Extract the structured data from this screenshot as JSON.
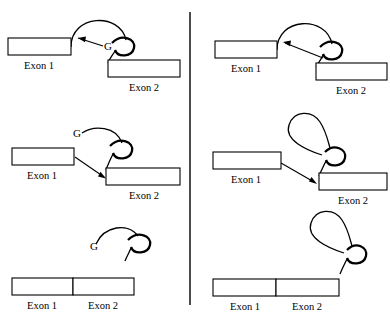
{
  "figure": {
    "background_color": "#ffffff",
    "ink_color": "#000000",
    "width": 390,
    "height": 319,
    "divider": {
      "x": 190,
      "y1": 12,
      "y2": 305
    }
  },
  "labels": {
    "exon1": "Exon 1",
    "exon2": "Exon 2",
    "branch_g": "G"
  },
  "panels": [
    {
      "id": "left-column",
      "name": "group-ii-style-lariat-with-g",
      "rows": [
        {
          "id": "left-row-1",
          "stage": "pre-splice-arched-intron",
          "exon1_label": "Exon 1",
          "exon2_label": "Exon 2",
          "branch_label": "G",
          "has_branch_label": true,
          "has_arrow": true,
          "arrow_direction": "right-to-left",
          "intron_shape": "arch"
        },
        {
          "id": "left-row-2",
          "stage": "first-transesterification-lariat-forming",
          "exon1_label": "Exon 1",
          "exon2_label": "Exon 2",
          "branch_label": "G",
          "has_branch_label": true,
          "has_arrow": true,
          "arrow_direction": "left-to-right",
          "intron_shape": "open-lariat"
        },
        {
          "id": "left-row-3",
          "stage": "ligated-exons-released-lariat",
          "exon1_label": "Exon 1",
          "exon2_label": "Exon 2",
          "branch_label": "G",
          "has_branch_label": true,
          "has_arrow": false,
          "intron_shape": "released-lariat"
        }
      ]
    },
    {
      "id": "right-column",
      "name": "spliceosomal-style-lariat-no-g",
      "rows": [
        {
          "id": "right-row-1",
          "stage": "pre-splice-arched-intron",
          "exon1_label": "Exon 1",
          "exon2_label": "Exon 2",
          "branch_label": "",
          "has_branch_label": false,
          "has_arrow": true,
          "arrow_direction": "right-to-left",
          "intron_shape": "arch"
        },
        {
          "id": "right-row-2",
          "stage": "first-transesterification-lariat-forming",
          "exon1_label": "Exon 1",
          "exon2_label": "Exon 2",
          "branch_label": "",
          "has_branch_label": false,
          "has_arrow": true,
          "arrow_direction": "left-to-right",
          "intron_shape": "teardrop-lariat"
        },
        {
          "id": "right-row-3",
          "stage": "ligated-exons-released-lariat",
          "exon1_label": "Exon 1",
          "exon2_label": "Exon 2",
          "branch_label": "",
          "has_branch_label": false,
          "has_arrow": false,
          "intron_shape": "released-teardrop-lariat"
        }
      ]
    }
  ]
}
